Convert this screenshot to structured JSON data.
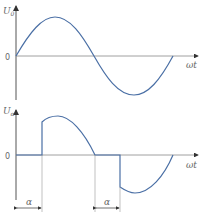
{
  "diagram": {
    "top_plot": {
      "y_label": "U",
      "y_label_sub": "0",
      "zero_label": "0",
      "x_label": "ωt",
      "curve": "full sine wave, one period"
    },
    "bottom_plot": {
      "y_label": "U",
      "y_label_sub": "α",
      "zero_label": "0",
      "x_label": "ωt",
      "curve": "phase-angle controlled sine (delayed by firing angle α each half-cycle)",
      "alpha_label_1": "α",
      "alpha_label_2": "α"
    },
    "colors": {
      "curve": "#4a6fa5",
      "axis": "#555555",
      "text": "#666666"
    }
  }
}
